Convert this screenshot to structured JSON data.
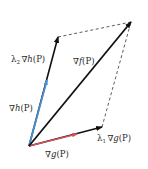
{
  "diagram": {
    "type": "vector-parallelogram",
    "colors": {
      "grad_h": "#4a8fd0",
      "grad_g": "#d0525a",
      "scaled": "#111111",
      "grad_f": "#111111",
      "dashed": "#333333"
    },
    "labels": {
      "lambda2_grad_h": {
        "prefix": "λ",
        "sub": "2",
        "nabla": "∇",
        "fn": "h",
        "arg": "(P)"
      },
      "grad_h": {
        "nabla": "∇",
        "fn": "h",
        "arg": "(P)"
      },
      "grad_f": {
        "nabla": "∇",
        "fn": "f",
        "arg": "(P)"
      },
      "grad_g": {
        "nabla": "∇",
        "fn": "g",
        "arg": "(P)"
      },
      "lambda1_grad_g": {
        "prefix": "λ",
        "sub": "1",
        "nabla": "∇",
        "fn": "g",
        "arg": "(P)"
      }
    },
    "relation": "∇f(P) = λ1∇g(P) + λ2∇h(P)"
  }
}
